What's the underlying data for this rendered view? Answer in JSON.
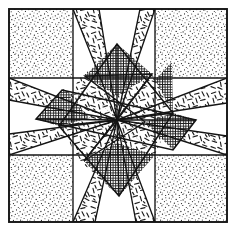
{
  "figure": {
    "type": "line-art-diagram",
    "width": 234,
    "height": 236,
    "background_color": "#ffffff",
    "line_color": "#1a1a1a",
    "caption": ""
  },
  "geometry": {
    "frame": {
      "left": 9,
      "top": 9,
      "right": 227,
      "bottom": 222
    },
    "grid_x": [
      9,
      73,
      155,
      227
    ],
    "grid_y": [
      9,
      78,
      155,
      222
    ],
    "center": {
      "x": 117,
      "y": 120
    },
    "grid_rows": 3,
    "grid_cols": 3,
    "star_points": 8
  },
  "patches": [
    {
      "id": "corner-top-left",
      "fill": "stipple",
      "label": "corner square"
    },
    {
      "id": "corner-top-right",
      "fill": "stipple",
      "label": "corner square"
    },
    {
      "id": "corner-bottom-left",
      "fill": "stipple",
      "label": "corner square"
    },
    {
      "id": "corner-bottom-right",
      "fill": "stipple",
      "label": "corner square"
    },
    {
      "id": "star-point-n",
      "fill": "dash",
      "label": "star point north"
    },
    {
      "id": "star-point-ne",
      "fill": "dash",
      "label": "star point north-east"
    },
    {
      "id": "star-point-e",
      "fill": "dash",
      "label": "star point east"
    },
    {
      "id": "star-point-se",
      "fill": "dash",
      "label": "star point south-east"
    },
    {
      "id": "star-point-s",
      "fill": "dash",
      "label": "star point south"
    },
    {
      "id": "star-point-sw",
      "fill": "dash",
      "label": "star point south-west"
    },
    {
      "id": "star-point-w",
      "fill": "dash",
      "label": "star point west"
    },
    {
      "id": "star-point-nw",
      "fill": "dash",
      "label": "star point north-west"
    },
    {
      "id": "rotated-square-a",
      "fill": "crosshatch",
      "label": "rotated inner square A"
    },
    {
      "id": "rotated-square-b",
      "fill": "crosshatch",
      "label": "rotated inner square B"
    },
    {
      "id": "background-n",
      "fill": "none",
      "label": "background wedge north"
    },
    {
      "id": "background-e",
      "fill": "none",
      "label": "background wedge east"
    },
    {
      "id": "background-s",
      "fill": "none",
      "label": "background wedge south"
    },
    {
      "id": "background-w",
      "fill": "none",
      "label": "background wedge west"
    }
  ],
  "legend": {
    "stipple_label": "stipple fill",
    "dash_label": "dash fill",
    "crosshatch_label": "crosshatch fill",
    "plain_label": "plain / unfilled"
  }
}
